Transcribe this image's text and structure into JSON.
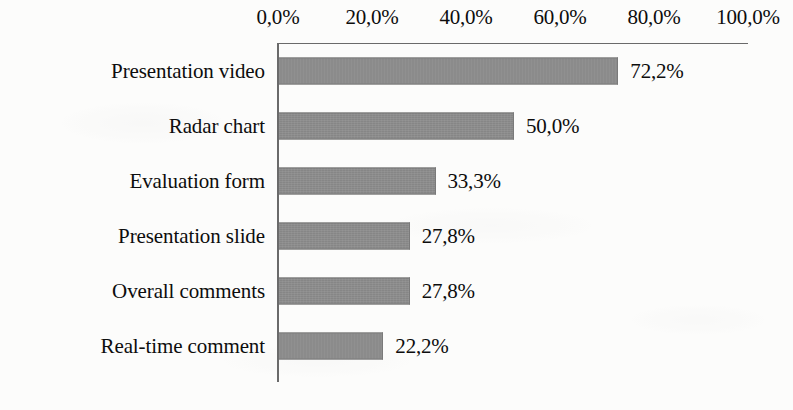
{
  "chart_data": {
    "type": "bar",
    "orientation": "horizontal",
    "title": "",
    "xlabel": "",
    "ylabel": "",
    "xlim": [
      0,
      100
    ],
    "grid": false,
    "legend": null,
    "decimal_separator": ",",
    "categories": [
      "Presentation video",
      "Radar chart",
      "Evaluation form",
      "Presentation slide",
      "Overall comments",
      "Real-time comment"
    ],
    "values": [
      72.2,
      50.0,
      33.3,
      27.8,
      27.8,
      22.2
    ],
    "value_labels": [
      "72,2%",
      "50,0%",
      "33,3%",
      "27,8%",
      "27,8%",
      "22,2%"
    ],
    "xticks": [
      0,
      20,
      40,
      60,
      80,
      100
    ],
    "xtick_labels": [
      "0,0%",
      "20,0%",
      "40,0%",
      "60,0%",
      "80,0%",
      "100,0%"
    ],
    "bar_color": "#8b8b8b",
    "bar_edge_color": "#7a7a7a",
    "axis_color": "#6a6a6a",
    "background_color": "#fcfcfb",
    "text_color": "#0d0d0d"
  }
}
